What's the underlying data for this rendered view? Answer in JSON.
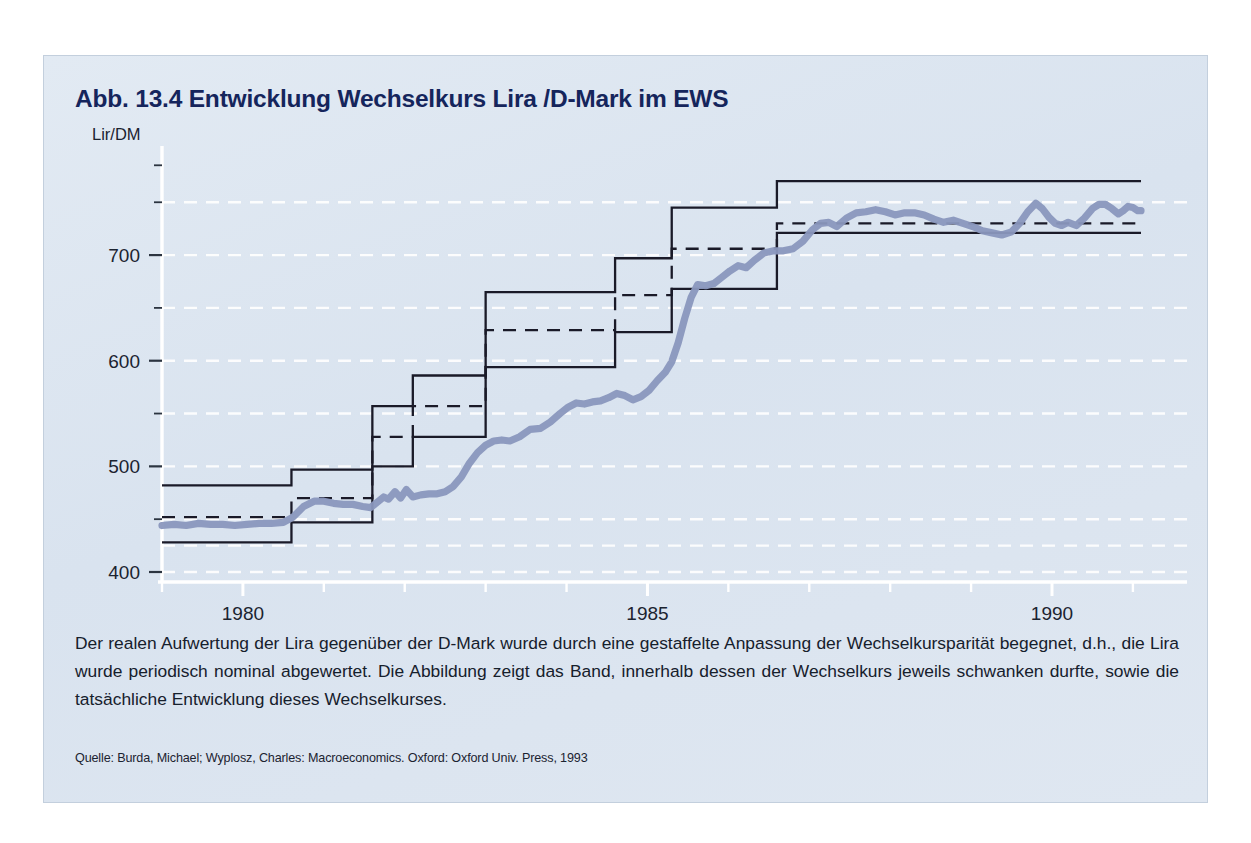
{
  "figure": {
    "title": "Abb. 13.4  Entwicklung Wechselkurs Lira /D-Mark im EWS",
    "caption": "Der realen Aufwertung der Lira gegenüber der D-Mark wurde durch eine gestaffelte Anpassung der Wechselkursparität begegnet, d.h., die Lira wurde periodisch nominal abgewertet. Die Abbildung zeigt das Band, innerhalb dessen der Wechselkurs jeweils schwanken durfte, sowie die tatsächliche Entwicklung dieses Wechselkurses.",
    "source": "Quelle: Burda, Michael; Wyplosz, Charles: Macroeconomics. Oxford: Oxford Univ. Press, 1993",
    "panel_color": "#dde6f0",
    "title_color": "#15255c",
    "rate_line_color": "#8a97bd",
    "band_line_color": "#1a1a28"
  },
  "chart_data": {
    "type": "line",
    "title": "Entwicklung Wechselkurs Lira /D-Mark im EWS",
    "xlabel": "",
    "ylabel": "Lir/DM",
    "ylim": [
      400,
      790
    ],
    "xlim": [
      1979.0,
      1991.1
    ],
    "yticks": [
      400,
      500,
      600,
      700
    ],
    "yticklabels": [
      "400",
      "500",
      "600",
      "700"
    ],
    "yminorticks": [
      450,
      550,
      650,
      750
    ],
    "xticks": [
      1980,
      1985,
      1990
    ],
    "xticklabels": [
      "1980",
      "1985",
      "1990"
    ],
    "xminorticks": [
      1979,
      1981,
      1982,
      1983,
      1984,
      1986,
      1987,
      1988,
      1989,
      1991
    ],
    "grid": "horizontal-dashed-white",
    "legend": "none",
    "series": [
      {
        "name": "Oberes Bandende",
        "style": "step-solid",
        "color": "#1a1a28",
        "points": [
          [
            1979.0,
            482
          ],
          [
            1980.6,
            482
          ],
          [
            1980.6,
            497
          ],
          [
            1981.6,
            497
          ],
          [
            1981.6,
            557
          ],
          [
            1982.1,
            557
          ],
          [
            1982.1,
            586
          ],
          [
            1983.0,
            586
          ],
          [
            1983.0,
            665
          ],
          [
            1984.6,
            665
          ],
          [
            1984.6,
            697
          ],
          [
            1985.3,
            697
          ],
          [
            1985.3,
            745
          ],
          [
            1986.6,
            745
          ],
          [
            1986.6,
            770
          ],
          [
            1991.1,
            770
          ]
        ]
      },
      {
        "name": "Leitkurs (Parität)",
        "style": "step-dashed",
        "color": "#1a1a28",
        "points": [
          [
            1979.0,
            452
          ],
          [
            1980.6,
            452
          ],
          [
            1980.6,
            470
          ],
          [
            1981.6,
            470
          ],
          [
            1981.6,
            528
          ],
          [
            1982.1,
            528
          ],
          [
            1982.1,
            557
          ],
          [
            1983.0,
            557
          ],
          [
            1983.0,
            629
          ],
          [
            1984.6,
            629
          ],
          [
            1984.6,
            662
          ],
          [
            1985.3,
            662
          ],
          [
            1985.3,
            706
          ],
          [
            1986.6,
            706
          ],
          [
            1986.6,
            730
          ],
          [
            1991.1,
            730
          ]
        ]
      },
      {
        "name": "Unteres Bandende",
        "style": "step-solid",
        "color": "#1a1a28",
        "points": [
          [
            1979.0,
            428
          ],
          [
            1980.6,
            428
          ],
          [
            1980.6,
            447
          ],
          [
            1981.6,
            447
          ],
          [
            1981.6,
            500
          ],
          [
            1982.1,
            500
          ],
          [
            1982.1,
            528
          ],
          [
            1983.0,
            528
          ],
          [
            1983.0,
            594
          ],
          [
            1984.6,
            594
          ],
          [
            1984.6,
            627
          ],
          [
            1985.3,
            627
          ],
          [
            1985.3,
            668
          ],
          [
            1986.6,
            668
          ],
          [
            1986.6,
            721
          ],
          [
            1991.1,
            721
          ]
        ]
      },
      {
        "name": "Tatsächlicher Wechselkurs",
        "style": "line-thick",
        "color": "#8a97bd",
        "points": [
          [
            1979.0,
            444
          ],
          [
            1979.15,
            445
          ],
          [
            1979.3,
            444
          ],
          [
            1979.45,
            446
          ],
          [
            1979.6,
            445
          ],
          [
            1979.75,
            445
          ],
          [
            1979.9,
            444
          ],
          [
            1980.05,
            445
          ],
          [
            1980.2,
            446
          ],
          [
            1980.35,
            446
          ],
          [
            1980.5,
            447
          ],
          [
            1980.62,
            452
          ],
          [
            1980.75,
            462
          ],
          [
            1980.88,
            467
          ],
          [
            1981.0,
            467
          ],
          [
            1981.12,
            465
          ],
          [
            1981.24,
            464
          ],
          [
            1981.36,
            464
          ],
          [
            1981.48,
            462
          ],
          [
            1981.58,
            461
          ],
          [
            1981.66,
            466
          ],
          [
            1981.74,
            471
          ],
          [
            1981.8,
            469
          ],
          [
            1981.88,
            476
          ],
          [
            1981.95,
            470
          ],
          [
            1982.02,
            478
          ],
          [
            1982.1,
            471
          ],
          [
            1982.2,
            473
          ],
          [
            1982.3,
            474
          ],
          [
            1982.4,
            474
          ],
          [
            1982.5,
            476
          ],
          [
            1982.6,
            481
          ],
          [
            1982.7,
            490
          ],
          [
            1982.8,
            503
          ],
          [
            1982.9,
            513
          ],
          [
            1983.0,
            520
          ],
          [
            1983.1,
            524
          ],
          [
            1983.2,
            525
          ],
          [
            1983.3,
            524
          ],
          [
            1983.42,
            528
          ],
          [
            1983.55,
            535
          ],
          [
            1983.68,
            536
          ],
          [
            1983.8,
            542
          ],
          [
            1983.92,
            550
          ],
          [
            1984.02,
            556
          ],
          [
            1984.12,
            560
          ],
          [
            1984.22,
            559
          ],
          [
            1984.32,
            561
          ],
          [
            1984.42,
            562
          ],
          [
            1984.52,
            565
          ],
          [
            1984.62,
            569
          ],
          [
            1984.72,
            567
          ],
          [
            1984.82,
            563
          ],
          [
            1984.92,
            566
          ],
          [
            1985.02,
            572
          ],
          [
            1985.12,
            581
          ],
          [
            1985.22,
            589
          ],
          [
            1985.3,
            599
          ],
          [
            1985.38,
            617
          ],
          [
            1985.46,
            640
          ],
          [
            1985.54,
            660
          ],
          [
            1985.62,
            672
          ],
          [
            1985.72,
            671
          ],
          [
            1985.82,
            673
          ],
          [
            1985.92,
            679
          ],
          [
            1986.02,
            685
          ],
          [
            1986.12,
            690
          ],
          [
            1986.22,
            688
          ],
          [
            1986.32,
            695
          ],
          [
            1986.44,
            702
          ],
          [
            1986.56,
            704
          ],
          [
            1986.68,
            704
          ],
          [
            1986.8,
            706
          ],
          [
            1986.92,
            713
          ],
          [
            1987.04,
            724
          ],
          [
            1987.14,
            730
          ],
          [
            1987.24,
            731
          ],
          [
            1987.34,
            727
          ],
          [
            1987.46,
            735
          ],
          [
            1987.58,
            740
          ],
          [
            1987.7,
            741
          ],
          [
            1987.82,
            743
          ],
          [
            1987.94,
            741
          ],
          [
            1988.06,
            738
          ],
          [
            1988.18,
            740
          ],
          [
            1988.3,
            740
          ],
          [
            1988.42,
            738
          ],
          [
            1988.54,
            734
          ],
          [
            1988.66,
            731
          ],
          [
            1988.78,
            733
          ],
          [
            1988.9,
            730
          ],
          [
            1989.02,
            727
          ],
          [
            1989.14,
            723
          ],
          [
            1989.26,
            721
          ],
          [
            1989.38,
            719
          ],
          [
            1989.5,
            722
          ],
          [
            1989.6,
            730
          ],
          [
            1989.7,
            741
          ],
          [
            1989.8,
            749
          ],
          [
            1989.88,
            744
          ],
          [
            1989.96,
            736
          ],
          [
            1990.04,
            730
          ],
          [
            1990.12,
            728
          ],
          [
            1990.2,
            731
          ],
          [
            1990.3,
            728
          ],
          [
            1990.4,
            735
          ],
          [
            1990.5,
            744
          ],
          [
            1990.58,
            748
          ],
          [
            1990.66,
            748
          ],
          [
            1990.74,
            744
          ],
          [
            1990.82,
            739
          ],
          [
            1990.88,
            742
          ],
          [
            1990.94,
            746
          ],
          [
            1991.0,
            745
          ],
          [
            1991.06,
            742
          ],
          [
            1991.1,
            742
          ]
        ]
      }
    ]
  }
}
